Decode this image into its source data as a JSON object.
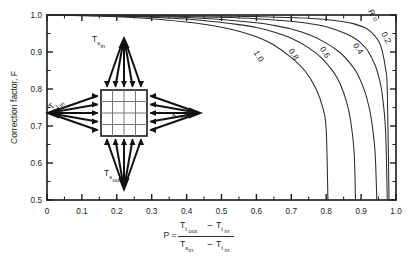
{
  "figure": {
    "name": "lmtd-correction-factor-crossflow-chart"
  },
  "axes": {
    "y_title": "Correction factor, F",
    "x_title_lead": "P =",
    "x_formula": {
      "numerator_a": "T",
      "numerator_a_sub": "t",
      "numerator_a_sub2": "out",
      "minus": "–",
      "numerator_b": "T",
      "numerator_b_sub": "t",
      "numerator_b_sub2": "in",
      "denominator_a": "T",
      "denominator_a_sub": "s",
      "denominator_a_sub2": "in",
      "denominator_b": "T",
      "denominator_b_sub": "t",
      "denominator_b_sub2": "in"
    },
    "x_ticks": [
      "0",
      "0.1",
      "0.2",
      "0.3",
      "0.4",
      "0.5",
      "0.6",
      "0.7",
      "0.8",
      "0.9",
      "1.0"
    ],
    "y_ticks": [
      "1.0",
      "0.9",
      "0.8",
      "0.7",
      "0.6",
      "0.5"
    ]
  },
  "schematic": {
    "label_top": {
      "base": "T",
      "sub": "s",
      "sub2": "in"
    },
    "label_left": {
      "base": "T",
      "sub": "t",
      "sub2": "in"
    },
    "label_right": {
      "base": "T",
      "sub": "t",
      "sub2": "out"
    },
    "label_bottom": {
      "base": "T",
      "sub": "s",
      "sub2": "out"
    },
    "grid_rows": 4,
    "grid_cols": 4
  },
  "legend": {
    "r_prefix": "R =",
    "r_prefix_value": "0.2"
  },
  "colors": {
    "axis": "#1a1a1a",
    "curve": "#2b2b2b",
    "background": "#ffffff",
    "arrow": "#111111"
  },
  "chart_data": {
    "type": "line",
    "title": "",
    "xlabel": "P = (Tt,out - Tt,in) / (Ts,in - Tt,in)",
    "ylabel": "Correction factor, F",
    "xlim": [
      0,
      1.0
    ],
    "ylim": [
      0.5,
      1.0
    ],
    "grid": false,
    "legend_position": "inline-on-curves",
    "x_major_step": 0.1,
    "x_minor_step": 0.05,
    "y_major_step": 0.1,
    "y_minor_step": 0.05,
    "series": [
      {
        "name": "R = 0.2",
        "label": "0.2",
        "label_at": {
          "x": 0.965,
          "y": 0.935
        },
        "x": [
          0.0,
          0.1,
          0.2,
          0.3,
          0.4,
          0.5,
          0.6,
          0.7,
          0.75,
          0.8,
          0.85,
          0.88,
          0.91,
          0.93,
          0.95,
          0.96,
          0.97,
          0.975,
          0.98
        ],
        "y": [
          1.0,
          1.0,
          0.999,
          0.999,
          0.998,
          0.997,
          0.996,
          0.993,
          0.991,
          0.988,
          0.982,
          0.976,
          0.966,
          0.953,
          0.93,
          0.905,
          0.855,
          0.8,
          0.5
        ]
      },
      {
        "name": "R = 0.4",
        "label": "0.4",
        "label_at": {
          "x": 0.885,
          "y": 0.905
        },
        "x": [
          0.0,
          0.1,
          0.2,
          0.3,
          0.4,
          0.5,
          0.6,
          0.7,
          0.75,
          0.8,
          0.85,
          0.88,
          0.9,
          0.92,
          0.94,
          0.95,
          0.96,
          0.97,
          0.975
        ],
        "y": [
          1.0,
          1.0,
          0.999,
          0.998,
          0.996,
          0.994,
          0.99,
          0.983,
          0.977,
          0.968,
          0.952,
          0.938,
          0.924,
          0.902,
          0.865,
          0.835,
          0.79,
          0.69,
          0.5
        ]
      },
      {
        "name": "R = 0.6",
        "label": "0.6",
        "label_at": {
          "x": 0.79,
          "y": 0.895
        },
        "x": [
          0.0,
          0.1,
          0.2,
          0.3,
          0.4,
          0.5,
          0.6,
          0.65,
          0.7,
          0.75,
          0.8,
          0.84,
          0.87,
          0.89,
          0.91,
          0.92,
          0.93,
          0.94,
          0.945
        ],
        "y": [
          1.0,
          0.999,
          0.998,
          0.996,
          0.993,
          0.988,
          0.979,
          0.972,
          0.962,
          0.947,
          0.924,
          0.898,
          0.868,
          0.84,
          0.795,
          0.762,
          0.715,
          0.63,
          0.5
        ]
      },
      {
        "name": "R = 0.8",
        "label": "0.8",
        "label_at": {
          "x": 0.7,
          "y": 0.89
        },
        "x": [
          0.0,
          0.1,
          0.2,
          0.3,
          0.4,
          0.5,
          0.55,
          0.6,
          0.65,
          0.7,
          0.75,
          0.79,
          0.82,
          0.84,
          0.86,
          0.87,
          0.88,
          0.884
        ],
        "y": [
          1.0,
          0.999,
          0.997,
          0.994,
          0.989,
          0.98,
          0.974,
          0.966,
          0.954,
          0.937,
          0.911,
          0.881,
          0.847,
          0.814,
          0.76,
          0.714,
          0.63,
          0.5
        ]
      },
      {
        "name": "R = 1.0",
        "label": "1.0",
        "label_at": {
          "x": 0.6,
          "y": 0.885
        },
        "x": [
          0.0,
          0.1,
          0.2,
          0.3,
          0.4,
          0.45,
          0.5,
          0.55,
          0.6,
          0.65,
          0.7,
          0.74,
          0.77,
          0.79,
          0.8,
          0.805
        ],
        "y": [
          1.0,
          0.998,
          0.995,
          0.99,
          0.981,
          0.975,
          0.967,
          0.956,
          0.941,
          0.919,
          0.885,
          0.848,
          0.802,
          0.75,
          0.69,
          0.5
        ]
      }
    ]
  }
}
